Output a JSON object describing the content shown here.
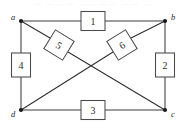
{
  "figure": {
    "caption": "",
    "artifact_text": "— ——— ———— —— —",
    "colors": {
      "background": "#ffffff",
      "line": "#3c3c3c",
      "box_stroke": "#4a4a4a",
      "box_fill": "#ffffff",
      "vertex_dot": "#1a1a1a",
      "text": "#2b2b2b"
    },
    "vertices": [
      {
        "id": "a",
        "label": "a",
        "x": 21,
        "y": 21,
        "label_x": 13,
        "label_y": 17
      },
      {
        "id": "b",
        "label": "b",
        "x": 165,
        "y": 21,
        "label_x": 173,
        "label_y": 17
      },
      {
        "id": "c",
        "label": "c",
        "x": 165,
        "y": 110,
        "label_x": 173,
        "label_y": 114
      },
      {
        "id": "d",
        "label": "d",
        "x": 21,
        "y": 110,
        "label_x": 13,
        "label_y": 114
      }
    ],
    "elements": [
      {
        "id": "element-1",
        "label": "1",
        "edge": "a-b",
        "orientation": "horizontal",
        "cx": 93,
        "cy": 21,
        "w": 24,
        "h": 19,
        "rotation": 0
      },
      {
        "id": "element-2",
        "label": "2",
        "edge": "b-c",
        "orientation": "vertical",
        "cx": 165,
        "cy": 65,
        "w": 19,
        "h": 24,
        "rotation": 0
      },
      {
        "id": "element-3",
        "label": "3",
        "edge": "d-c",
        "orientation": "horizontal",
        "cx": 93,
        "cy": 110,
        "w": 24,
        "h": 19,
        "rotation": 0
      },
      {
        "id": "element-4",
        "label": "4",
        "edge": "a-d",
        "orientation": "vertical",
        "cx": 21,
        "cy": 65,
        "w": 19,
        "h": 24,
        "rotation": 0
      },
      {
        "id": "element-5",
        "label": "5",
        "edge": "a-c",
        "orientation": "diagonal",
        "cx": 59,
        "cy": 45,
        "w": 22,
        "h": 22,
        "rotation": 31.7
      },
      {
        "id": "element-6",
        "label": "6",
        "edge": "b-d",
        "orientation": "diagonal",
        "cx": 122,
        "cy": 45,
        "w": 22,
        "h": 22,
        "rotation": -31.7
      }
    ],
    "edges": [
      {
        "id": "edge-a-b",
        "from": "a",
        "to": "b",
        "kind": "side"
      },
      {
        "id": "edge-b-c",
        "from": "b",
        "to": "c",
        "kind": "side"
      },
      {
        "id": "edge-d-c",
        "from": "d",
        "to": "c",
        "kind": "side"
      },
      {
        "id": "edge-a-d",
        "from": "a",
        "to": "d",
        "kind": "side"
      },
      {
        "id": "edge-a-c",
        "from": "a",
        "to": "c",
        "kind": "diagonal"
      },
      {
        "id": "edge-b-d",
        "from": "b",
        "to": "d",
        "kind": "diagonal"
      }
    ]
  }
}
